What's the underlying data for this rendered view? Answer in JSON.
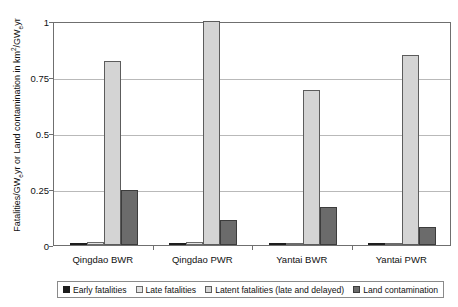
{
  "clipped_top_text": "",
  "chart_data": {
    "type": "bar",
    "title": "",
    "xlabel": "",
    "ylabel": "Fatalities/GWeyr or Land contamination in km2/GWeyr",
    "ylabel_parts": {
      "pre_sup": "Fatalities/GW",
      "sub1": "e",
      "mid": "yr or Land contamination in km",
      "sup1": "2",
      "mid2": "/GW",
      "sub2": "e",
      "tail": "yr"
    },
    "ylim": [
      0,
      1
    ],
    "yticks": [
      0,
      0.25,
      0.5,
      0.75,
      1
    ],
    "ytick_labels": [
      "0",
      "0.25",
      "0.5",
      "0.75",
      "1"
    ],
    "grid": true,
    "legend_position": "bottom",
    "categories": [
      "Qingdao BWR",
      "Qingdao PWR",
      "Yantai BWR",
      "Yantai PWR"
    ],
    "series": [
      {
        "name": "Early fatalities",
        "color": "#1d1d1d",
        "values": [
          0.002,
          0.004,
          0.001,
          0.003
        ]
      },
      {
        "name": "Late fatalities",
        "color": "#e3e3e3",
        "values": [
          0.012,
          0.013,
          0.008,
          0.009
        ]
      },
      {
        "name": "Latent fatalities (late and delayed)",
        "color": "#d4d4d4",
        "values": [
          0.82,
          1.0,
          0.69,
          0.85
        ]
      },
      {
        "name": "Land contamination",
        "color": "#6b6b6b",
        "values": [
          0.245,
          0.11,
          0.17,
          0.08
        ]
      }
    ]
  }
}
